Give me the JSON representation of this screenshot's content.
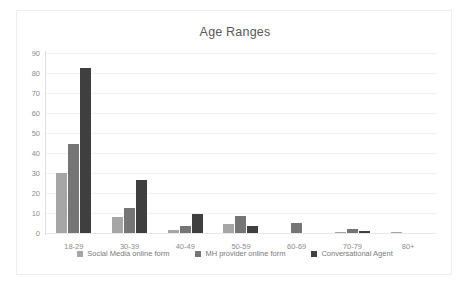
{
  "chart_data": {
    "type": "bar",
    "title": "Age Ranges",
    "xlabel": "",
    "ylabel": "",
    "ylim": [
      0,
      90
    ],
    "ytick_step": 10,
    "yticks": [
      90,
      80,
      70,
      60,
      50,
      40,
      30,
      20,
      10,
      0
    ],
    "grid": true,
    "legend_position": "bottom",
    "categories": [
      "18-29",
      "30-39",
      "40-49",
      "50-59",
      "60-69",
      "70-79",
      "80+"
    ],
    "series": [
      {
        "name": "Social Media online form",
        "color": "#a6a6a6",
        "values": [
          30,
          8,
          1.5,
          4.5,
          0,
          0.5,
          0.5
        ]
      },
      {
        "name": "MH provider online form",
        "color": "#757575",
        "values": [
          44.5,
          12.5,
          3.5,
          8.5,
          5,
          2,
          0
        ]
      },
      {
        "name": "Conversational Agent",
        "color": "#3f3f3f",
        "values": [
          82.5,
          26.5,
          9.5,
          3.5,
          0,
          1,
          0
        ]
      }
    ]
  }
}
